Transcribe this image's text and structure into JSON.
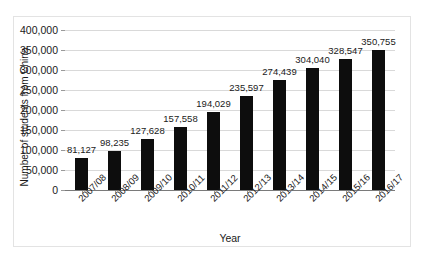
{
  "chart_data": {
    "type": "bar",
    "title": "",
    "subtitle": "",
    "xlabel": "Year",
    "ylabel": "Number of students from China",
    "categories": [
      "2007/08",
      "2008/09",
      "2009/10",
      "2010/11",
      "2011/12",
      "2012/13",
      "2013/14",
      "2014/15",
      "2015/16",
      "2016/17"
    ],
    "values": [
      81127,
      98235,
      127628,
      157558,
      194029,
      235597,
      274439,
      304040,
      328547,
      350755
    ],
    "value_labels": [
      "81,127",
      "98,235",
      "127,628",
      "157,558",
      "194,029",
      "235,597",
      "274,439",
      "304,040",
      "328,547",
      "350,755"
    ],
    "ylim": [
      0,
      400000
    ],
    "ytick_step": 50000,
    "ytick_values": [
      400000,
      350000,
      300000,
      250000,
      200000,
      150000,
      100000,
      50000,
      0
    ],
    "ytick_labels": [
      "400,000",
      "350,000",
      "300,000",
      "250,000",
      "200,000",
      "150,000",
      "100,000",
      "50,000",
      "0"
    ],
    "grid": true,
    "legend": false,
    "legend_position": "none",
    "bar_color": "#0d0d0d",
    "gridline_color": "#d9d9d9",
    "axis_color": "#7a7a7a",
    "background_color": "#ffffff",
    "text_color": "#1a1a1a",
    "xtick_label_rotation": -45
  }
}
